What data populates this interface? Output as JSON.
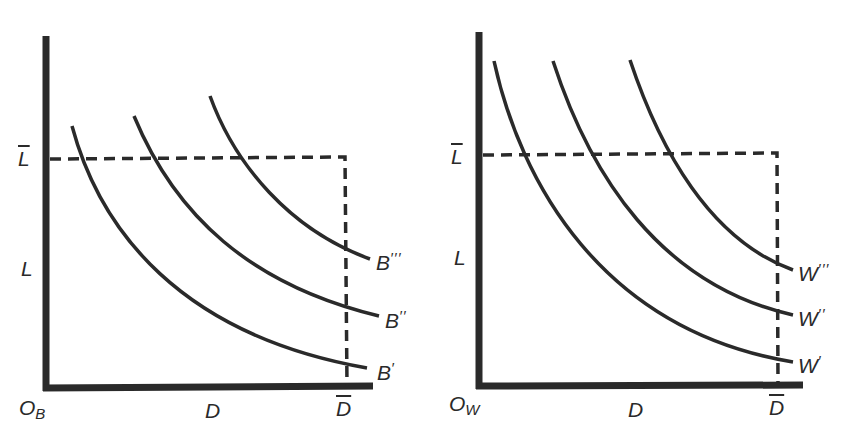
{
  "panels": [
    {
      "id": "left",
      "origin_label": "O",
      "origin_sub": "B",
      "x_label": "D",
      "x_bar_label": "D",
      "y_label": "L",
      "y_bar_label": "L",
      "curves": [
        {
          "name": "B",
          "primes": "′",
          "path": "M72,126 C100,230 180,335 367,368",
          "label_x": 377,
          "label_y": 358
        },
        {
          "name": "B",
          "primes": "′′",
          "path": "M134,116 C175,215 250,285 379,316",
          "label_x": 385,
          "label_y": 306
        },
        {
          "name": "B",
          "primes": "′′′",
          "path": "M210,96 C235,165 290,230 370,259",
          "label_x": 376,
          "label_y": 249
        }
      ]
    },
    {
      "id": "right",
      "origin_label": "O",
      "origin_sub": "W",
      "x_label": "D",
      "x_bar_label": "D",
      "y_label": "L",
      "y_bar_label": "L",
      "curves": [
        {
          "name": "W",
          "primes": "′",
          "path": "M494,61 C520,180 600,330 793,362",
          "label_x": 798,
          "label_y": 353
        },
        {
          "name": "W",
          "primes": "′′",
          "path": "M553,61 C590,175 660,285 793,315",
          "label_x": 798,
          "label_y": 306
        },
        {
          "name": "W",
          "primes": "′′′",
          "path": "M630,60 C660,150 710,240 793,270",
          "label_x": 798,
          "label_y": 260
        }
      ]
    }
  ],
  "colors": {
    "ink": "#2a2a2a",
    "background": "#ffffff"
  }
}
